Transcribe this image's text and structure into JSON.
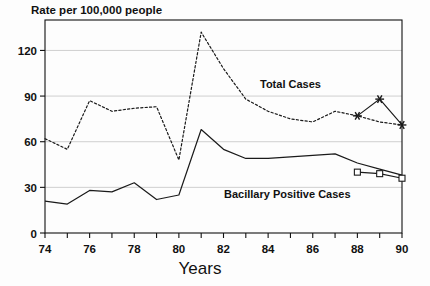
{
  "chart_data": {
    "type": "line",
    "title": "Rate per 100,000 people",
    "xlabel": "Years",
    "ylabel": "",
    "xlim": [
      74,
      90
    ],
    "ylim": [
      0,
      140
    ],
    "grid": true,
    "legend_position": "inline-annotation",
    "yticks": [
      0,
      30,
      60,
      90,
      120
    ],
    "ytick_labels": [
      "0",
      "30",
      "60",
      "90",
      "120"
    ],
    "xticks": [
      74,
      75,
      76,
      77,
      78,
      79,
      80,
      81,
      82,
      83,
      84,
      85,
      86,
      87,
      88,
      89,
      90
    ],
    "xtick_labels": [
      "74",
      "",
      "76",
      "",
      "78",
      "",
      "80",
      "",
      "82",
      "",
      "84",
      "",
      "86",
      "",
      "88",
      "",
      "90"
    ],
    "x": [
      74,
      75,
      76,
      77,
      78,
      79,
      80,
      81,
      82,
      83,
      84,
      85,
      86,
      87,
      88,
      89,
      90
    ],
    "series": [
      {
        "name": "Total Cases",
        "style": "dotted",
        "color": "#1a1a1a",
        "values": [
          62,
          55,
          87,
          80,
          82,
          83,
          48,
          132,
          108,
          88,
          80,
          75,
          73,
          80,
          77,
          73,
          71
        ],
        "label_text": "Total Cases"
      },
      {
        "name": "Bacillary Positive Cases",
        "style": "solid",
        "color": "#1a1a1a",
        "values": [
          21,
          19,
          28,
          27,
          33,
          22,
          25,
          68,
          55,
          49,
          49,
          50,
          51,
          52,
          46,
          42,
          38
        ],
        "label_text": "Bacillary Positive Cases"
      }
    ],
    "markers": [
      {
        "series": "Total Cases",
        "glyph": "asterisk",
        "x": [
          88,
          89,
          90
        ],
        "values": [
          77,
          88,
          71
        ],
        "connector": "solid"
      },
      {
        "series": "Bacillary Positive Cases",
        "glyph": "square",
        "x": [
          88,
          89,
          90
        ],
        "values": [
          40,
          39,
          36
        ],
        "connector": "solid"
      }
    ]
  },
  "annotations": {
    "total_cases_label": "Total Cases",
    "bacillary_label": "Bacillary Positive Cases"
  },
  "colors": {
    "ink": "#1a1a1a",
    "grid": "#c9c9c9",
    "axis": "#111111",
    "background": "#fdfdfd"
  }
}
